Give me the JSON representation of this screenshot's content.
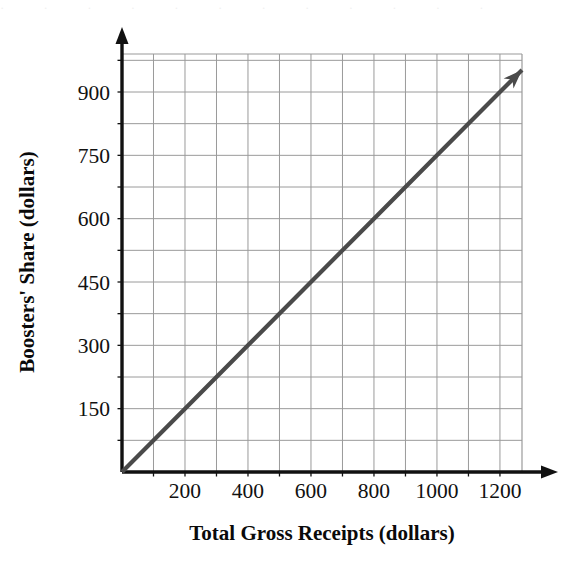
{
  "chart_data": {
    "type": "line",
    "title": "",
    "xlabel": "Total Gross Receipts (dollars)",
    "ylabel": "Boosters' Share (dollars)",
    "xlim": [
      0,
      1270
    ],
    "ylim": [
      0,
      990
    ],
    "grid": true,
    "legend": "none",
    "x_ticks": [
      200,
      400,
      600,
      800,
      1000,
      1200
    ],
    "x_tick_labels": [
      "200",
      "400",
      "600",
      "800",
      "1000",
      "1200"
    ],
    "y_ticks": [
      150,
      300,
      450,
      600,
      750,
      900
    ],
    "y_tick_labels": [
      "150",
      "300",
      "450",
      "600",
      "750",
      "900"
    ],
    "x_gridline_step": 100,
    "y_gridline_step": 75,
    "series": [
      {
        "name": "Boosters' Share",
        "color": "#4a4a4a",
        "arrow_end": true,
        "x": [
          0,
          200,
          400,
          600,
          800,
          1000,
          1200,
          1270
        ],
        "y": [
          0,
          150,
          300,
          450,
          600,
          750,
          900,
          952
        ]
      }
    ],
    "slope": 0.75,
    "intercept": 0
  },
  "axes": {
    "x_axis_name": "x-axis",
    "y_axis_name": "y-axis",
    "arrow_x": true,
    "arrow_y": true,
    "axis_color": "#111111",
    "grid_color": "#9a9a9a"
  },
  "scan_artifact": {
    "text": "· ·   ·   ·   ·   ·   ·   ·   ·   ·   ·   ·"
  }
}
